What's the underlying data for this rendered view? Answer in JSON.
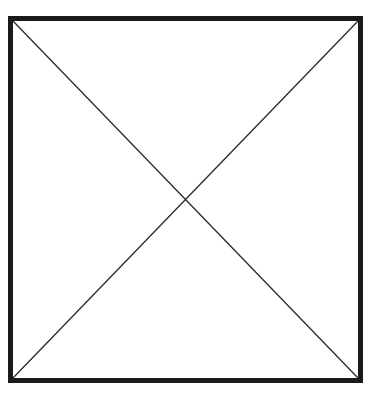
{
  "image_placeholder": {
    "alt": "Image placeholder",
    "frame": {
      "border_color": "#1a1a1a",
      "border_width": 5,
      "line_color": "#2a2a2a",
      "line_width": 1.3,
      "background": "#ffffff"
    }
  }
}
